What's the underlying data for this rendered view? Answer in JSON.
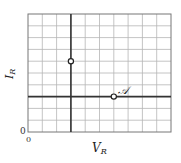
{
  "diagram": {
    "x_axis_label": "V",
    "x_axis_subscript": "R",
    "y_axis_label": "I",
    "y_axis_subscript": "R",
    "origin_x_label": "0",
    "origin_y_label": "0",
    "grid": {
      "columns": 10,
      "rows": 10
    },
    "bold_vertical_column": 3,
    "bold_horizontal_row_from_bottom": 3,
    "points": [
      {
        "name": "B",
        "label": "𝒝",
        "col": 3,
        "row_from_bottom": 6
      },
      {
        "name": "A",
        "label": "𝒜",
        "col": 6,
        "row_from_bottom": 3
      }
    ],
    "colors": {
      "grid": "#b5b5b5",
      "bold": "#333333",
      "frame": "#777777"
    }
  }
}
